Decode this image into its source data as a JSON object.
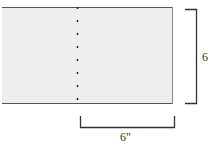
{
  "diagram": {
    "shape": "rectangle",
    "fill_color": "#eeeeee",
    "stroke_color": "#444444",
    "fold_line": "dashed vertical",
    "right_dimension_label": "6",
    "bottom_dimension_label": "6\""
  }
}
